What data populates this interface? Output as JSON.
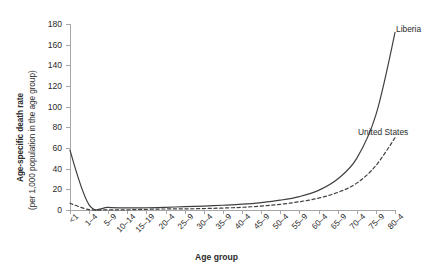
{
  "chart_data": {
    "type": "line",
    "title": "",
    "xlabel": "Age group",
    "ylabel_line1": "Age-specific death rate",
    "ylabel_line2": "(per 1,000 population in the age group)",
    "categories": [
      "<1",
      "1–4",
      "5–9",
      "10–14",
      "15–19",
      "20–4",
      "25–9",
      "30–4",
      "35–9",
      "40–4",
      "45–9",
      "50–4",
      "55–9",
      "60–4",
      "65–9",
      "70–4",
      "75–9",
      "80–4"
    ],
    "ylim": [
      0,
      180
    ],
    "yticks": [
      0,
      20,
      40,
      60,
      80,
      100,
      120,
      140,
      160,
      180
    ],
    "grid": false,
    "legend_position": "inline-annotation",
    "series": [
      {
        "name": "Liberia",
        "style": "solid",
        "color": "#404040",
        "values": [
          58,
          5,
          2.5,
          2,
          2.2,
          2.6,
          3.2,
          3.8,
          4.6,
          5.6,
          7.2,
          9.5,
          13,
          19,
          30,
          50,
          92,
          172
        ]
      },
      {
        "name": "United States",
        "style": "dashed",
        "color": "#404040",
        "values": [
          6.5,
          0.4,
          0.2,
          0.2,
          0.7,
          1.0,
          1.1,
          1.4,
          1.9,
          2.6,
          3.8,
          5.5,
          8.0,
          11.5,
          17,
          26,
          43,
          70
        ]
      }
    ],
    "annotations": [
      {
        "text": "Liberia",
        "name": "liberia-series-label"
      },
      {
        "text": "United States",
        "name": "united-states-series-label"
      }
    ]
  }
}
